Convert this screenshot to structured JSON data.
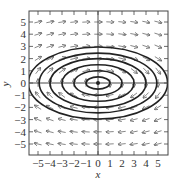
{
  "chart_data": {
    "type": "vector_field",
    "title": "",
    "xlabel": "x",
    "ylabel": "y",
    "xlim": [
      -5.75,
      5.8
    ],
    "ylim": [
      -5.9,
      5.95
    ],
    "xticks": [
      -5,
      -4,
      -3,
      -2,
      -1,
      0,
      1,
      2,
      3,
      4,
      5
    ],
    "yticks": [
      -5,
      -4,
      -3,
      -2,
      -1,
      0,
      1,
      2,
      3,
      4,
      5
    ],
    "xtick_labels": [
      "−5",
      "−4",
      "−3",
      "−2",
      "−1",
      "0",
      "1",
      "2",
      "3",
      "4",
      "5"
    ],
    "ytick_labels": [
      "−5",
      "−4",
      "−3",
      "−2",
      "−1",
      "0",
      "1",
      "2",
      "3",
      "4",
      "5"
    ],
    "grid": false,
    "field": {
      "dx_expr": "y",
      "dy_expr": "-x/4",
      "x_samples": [
        -5,
        -4,
        -3,
        -2,
        -1,
        0,
        1,
        2,
        3,
        4,
        5
      ],
      "y_samples": [
        -5,
        -4,
        -3,
        -2,
        -1,
        0,
        1,
        2,
        3,
        4,
        5
      ],
      "direction_note": "clockwise: rightward in upper half, leftward in lower half",
      "normalized_length": 0.62
    },
    "trajectories": {
      "shape": "ellipse",
      "equation": "x^2/4 + y^2 = C",
      "center": [
        0,
        0
      ],
      "semi_axes": [
        {
          "a": 1.0,
          "b": 0.5
        },
        {
          "a": 2.0,
          "b": 1.0
        },
        {
          "a": 3.0,
          "b": 1.5
        },
        {
          "a": 4.0,
          "b": 2.0
        },
        {
          "a": 4.9,
          "b": 2.45
        },
        {
          "a": 5.8,
          "b": 2.95
        }
      ]
    },
    "equilibrium_point": [
      0,
      0
    ]
  },
  "style": {
    "frame_color": "#444444",
    "axis_color": "#333333",
    "curve_color": "#222222",
    "arrow_color": "#555555",
    "background": "#ffffff"
  },
  "layout_px": {
    "frame": {
      "left": 29,
      "top": 11,
      "right": 168,
      "bottom": 155
    },
    "origin": {
      "x": 98,
      "y": 83
    },
    "px_per_unit_x": 12.0,
    "px_per_unit_y": 12.2,
    "xlabel_pos": {
      "x": 98,
      "y": 178
    },
    "ylabel_pos": {
      "x": 9,
      "y": 84
    }
  }
}
